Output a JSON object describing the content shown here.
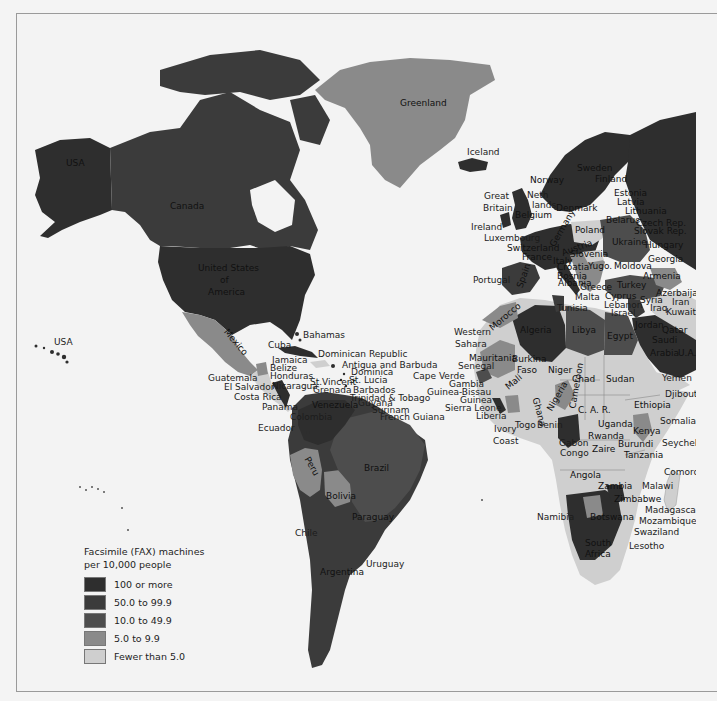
{
  "map": {
    "title": "Facsimile (FAX) machines per 10,000 people",
    "colors": {
      "background": "#f3f3f3",
      "ocean": "#f3f3f3",
      "class_100_plus": "#2e2e2e",
      "class_50_99": "#3b3b3b",
      "class_10_49": "#4d4d4d",
      "class_5_9": "#8a8a8a",
      "class_under_5": "#cfcfcf"
    }
  },
  "legend": {
    "title_line1": "Facsimile (FAX) machines",
    "title_line2": "per 10,000 people",
    "items": [
      {
        "label": "100 or more",
        "color": "#2e2e2e"
      },
      {
        "label": "50.0 to 99.9",
        "color": "#3b3b3b"
      },
      {
        "label": "10.0 to 49.9",
        "color": "#4d4d4d"
      },
      {
        "label": "5.0 to 9.9",
        "color": "#8a8a8a"
      },
      {
        "label": "Fewer than 5.0",
        "color": "#cfcfcf"
      }
    ]
  },
  "labels": {
    "north_america": {
      "usa_alaska": "USA",
      "canada": "Canada",
      "us_line1": "United States",
      "us_line2": "of",
      "us_line3": "America",
      "usa_hawaii": "USA",
      "greenland": "Greenland",
      "mexico": "Mexico",
      "bahamas": "Bahamas",
      "cuba": "Cuba",
      "dominican_republic": "Dominican Republic",
      "jamaica": "Jamaica",
      "belize": "Belize",
      "honduras": "Honduras",
      "guatemala": "Guatemala",
      "el_salvador": "El Salvador",
      "nicaragua": "Nicaragua",
      "costa_rica": "Costa Rica",
      "panama": "Panama",
      "antigua": "Antigua and Barbuda",
      "dominica": "Dominica",
      "st_lucia": "St. Lucia",
      "st_vincent": "St.Vincent",
      "grenada": "Grenada",
      "barbados": "Barbados",
      "trinidad": "Trinidad & Tobago"
    },
    "south_america": {
      "venezuela": "Venezuela",
      "guyana": "Guyana",
      "surinam": "Surinam",
      "french_guiana": "French Guiana",
      "colombia": "Colombia",
      "ecuador": "Ecuador",
      "peru": "Peru",
      "brazil": "Brazil",
      "bolivia": "Bolivia",
      "paraguay": "Paraguay",
      "chile": "Chile",
      "uruguay": "Uruguay",
      "argentina": "Argentina"
    },
    "europe": {
      "iceland": "Iceland",
      "norway": "Norway",
      "sweden": "Sweden",
      "finland": "Finland",
      "great_britain_1": "Great",
      "great_britain_2": "Britain",
      "netherlands_1": "Neth",
      "netherlands_2": "lands",
      "denmark": "Denmark",
      "ireland": "Ireland",
      "belgium": "Belgium",
      "luxembourg": "Luxembourg",
      "switzerland": "Switzerland",
      "france": "France",
      "portugal": "Portugal",
      "spain": "Spain",
      "germany": "Germany",
      "austria": "Austria",
      "italy": "Italy",
      "poland": "Poland",
      "estonia": "Estonia",
      "latvia": "Latvia",
      "lithuania": "Lithuania",
      "belarus": "Belarus",
      "czech": "Czech Rep.",
      "slovak": "Slovak Rep.",
      "ukraine": "Ukraine",
      "hungary": "Hungary",
      "slovenia": "Slovenia",
      "croatia": "Croatia",
      "bosnia": "Bosnia",
      "yugo": "Yugo.",
      "moldova": "Moldova",
      "albania": "Albania",
      "greece": "Greece",
      "malta": "Malta",
      "georgia": "Georgia",
      "armenia": "Armenia",
      "azerbaijan": "Azerbaijan",
      "turkey": "Turkey",
      "cyprus": "Cyprus"
    },
    "middle_east": {
      "syria": "Syria",
      "lebanon": "Lebanon",
      "israel": "Israel",
      "iraq": "Iraq",
      "iran": "Iran",
      "kuwait": "Kuwait",
      "jordan": "Jordan",
      "qatar": "Qatar",
      "saudi_1": "Saudi",
      "saudi_2": "Arabia",
      "uae": "U.A.E.",
      "yemen": "Yemen"
    },
    "africa": {
      "morocco": "Morocco",
      "western_sahara_1": "Western",
      "western_sahara_2": "Sahara",
      "algeria": "Algeria",
      "tunisia": "Tunisia",
      "libya": "Libya",
      "egypt": "Egypt",
      "mauritania": "Mauritania",
      "senegal": "Senegal",
      "cape_verde": "Cape Verde",
      "gambia": "Gambia",
      "guinea_bissau": "Guinea-Bissau",
      "guinea": "Guinea",
      "sierra_leone": "Sierra Leone",
      "liberia": "Liberia",
      "mali": "Mali",
      "burkina_1": "Burkina",
      "burkina_2": "Faso",
      "niger": "Niger",
      "chad": "Chad",
      "sudan": "Sudan",
      "ghana": "Ghana",
      "nigeria": "Nigeria",
      "cameroon": "Cameroon",
      "ivory_1": "Ivory",
      "ivory_2": "Coast",
      "togo": "Togo",
      "benin": "Benin",
      "car": "C. A. R.",
      "ethiopia": "Ethiopia",
      "djibouti": "Djibouti",
      "somalia": "Somalia",
      "uganda": "Uganda",
      "kenya": "Kenya",
      "rwanda": "Rwanda",
      "burundi": "Burundi",
      "tanzania": "Tanzania",
      "gabon": "Gabon",
      "congo": "Congo",
      "zaire": "Zaire",
      "seychelles": "Seychelles",
      "comoros": "Comoros",
      "angola": "Angola",
      "zambia": "Zambia",
      "malawi": "Malawi",
      "zimbabwe": "Zimbabwe",
      "madagascar": "Madagascar",
      "mozambique": "Mozambique",
      "namibia": "Namibia",
      "botswana": "Botswana",
      "swaziland": "Swaziland",
      "south_africa_1": "South",
      "south_africa_2": "Africa",
      "lesotho": "Lesotho"
    }
  }
}
